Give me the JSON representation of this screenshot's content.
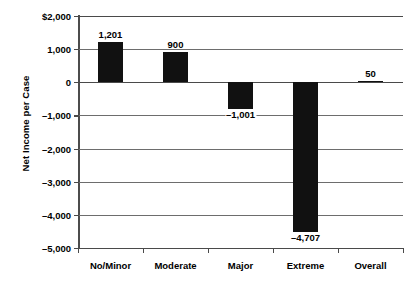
{
  "chart_data": {
    "type": "bar",
    "title": "",
    "subtitle": "",
    "xlabel": "",
    "ylabel": "Net Income per Case",
    "categories": [
      "No/Minor",
      "Moderate",
      "Major",
      "Extreme",
      "Overall"
    ],
    "values": [
      1201,
      900,
      -1001,
      -4707,
      50
    ],
    "value_labels": [
      "1,201",
      "900",
      "–1,001",
      "–4,707",
      "50"
    ],
    "series": [
      {
        "name": "Net Income per Case",
        "values": [
          1201,
          900,
          -1001,
          -4707,
          50
        ]
      }
    ],
    "ylim": [
      -5000,
      2000
    ],
    "ytick_values": [
      2000,
      1000,
      0,
      -1000,
      -2000,
      -3000,
      -4000,
      -5000
    ],
    "ytick_labels": [
      "$2,000",
      "1,000",
      "0",
      "–1,000",
      "–2,000",
      "–3,000",
      "–4,000",
      "–5,000"
    ],
    "grid": true,
    "legend": false,
    "legend_position": "none",
    "bar_color": "#111111",
    "axis_color": "#4a4a4a",
    "grid_color": "#6d6d6d",
    "background_color": "#ffffff"
  }
}
